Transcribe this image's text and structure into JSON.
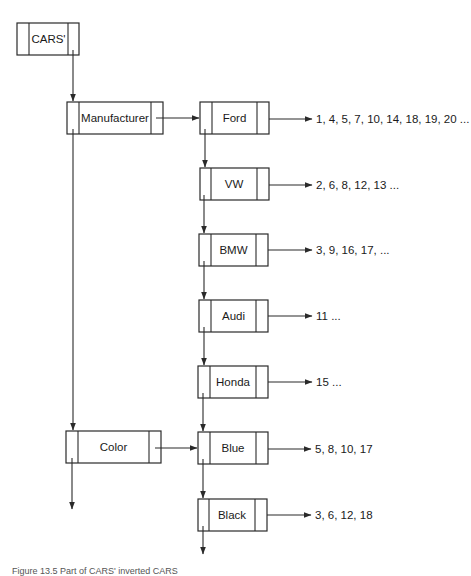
{
  "diagram": {
    "root": {
      "label": "CARS'"
    },
    "attributes": [
      {
        "label": "Manufacturer"
      },
      {
        "label": "Color"
      }
    ],
    "values": [
      {
        "attribute": "Manufacturer",
        "label": "Ford",
        "records": "1, 4, 5, 7, 10, 14, 18, 19, 20 ..."
      },
      {
        "attribute": "Manufacturer",
        "label": "VW",
        "records": "2, 6, 8, 12, 13 ..."
      },
      {
        "attribute": "Manufacturer",
        "label": "BMW",
        "records": "3, 9, 16, 17, ..."
      },
      {
        "attribute": "Manufacturer",
        "label": "Audi",
        "records": "11 ..."
      },
      {
        "attribute": "Manufacturer",
        "label": "Honda",
        "records": "15 ..."
      },
      {
        "attribute": "Color",
        "label": "Blue",
        "records": "5, 8, 10, 17"
      },
      {
        "attribute": "Color",
        "label": "Black",
        "records": "3, 6, 12, 18"
      }
    ],
    "caption": "Figure 13.5   Part of CARS' inverted CARS"
  },
  "colors": {
    "stroke": "#2a2a2a",
    "text": "#1a1a1a",
    "background": "#ffffff"
  }
}
